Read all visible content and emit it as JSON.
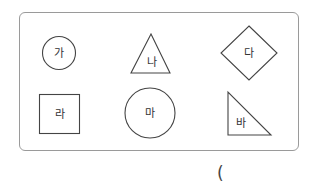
{
  "figure": {
    "shapes": [
      {
        "label": "가",
        "type": "circle"
      },
      {
        "label": "나",
        "type": "triangle"
      },
      {
        "label": "다",
        "type": "diamond"
      },
      {
        "label": "라",
        "type": "square"
      },
      {
        "label": "마",
        "type": "circle"
      },
      {
        "label": "바",
        "type": "right-triangle"
      }
    ]
  },
  "answer": {
    "open_paren": "("
  }
}
